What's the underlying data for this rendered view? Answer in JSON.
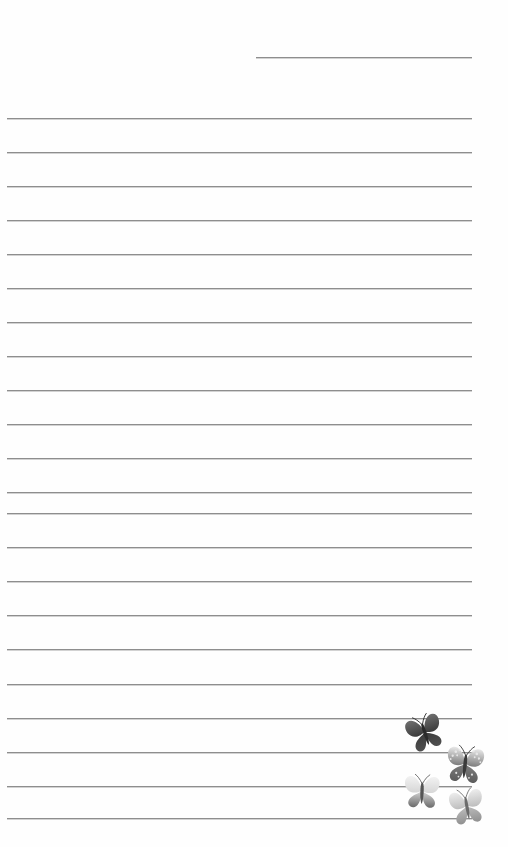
{
  "page": {
    "width": 508,
    "height": 847,
    "background_color": "#fefefe",
    "paper_style": "ruled-stationery"
  },
  "rules": {
    "line_color": "#8e8e8e",
    "shadow_color": "#d2d2d2",
    "line_thickness_px": 1,
    "left_margin_px": 7,
    "right_edge_px": 472,
    "line_spacing_px": 34,
    "header_line": {
      "label": "header-rule",
      "x": 256,
      "width": 216,
      "y": 57
    },
    "body_lines": [
      {
        "label": "line-1",
        "x": 7,
        "width": 465,
        "y": 118
      },
      {
        "label": "line-2",
        "x": 7,
        "width": 465,
        "y": 152
      },
      {
        "label": "line-3",
        "x": 7,
        "width": 465,
        "y": 186
      },
      {
        "label": "line-4",
        "x": 7,
        "width": 465,
        "y": 220
      },
      {
        "label": "line-5",
        "x": 7,
        "width": 465,
        "y": 254
      },
      {
        "label": "line-6",
        "x": 7,
        "width": 465,
        "y": 288
      },
      {
        "label": "line-7",
        "x": 7,
        "width": 465,
        "y": 322
      },
      {
        "label": "line-8",
        "x": 7,
        "width": 465,
        "y": 356
      },
      {
        "label": "line-9",
        "x": 7,
        "width": 465,
        "y": 390
      },
      {
        "label": "line-10",
        "x": 7,
        "width": 465,
        "y": 424
      },
      {
        "label": "line-11",
        "x": 7,
        "width": 465,
        "y": 458
      },
      {
        "label": "line-12",
        "x": 7,
        "width": 465,
        "y": 492
      },
      {
        "label": "line-13",
        "x": 7,
        "width": 465,
        "y": 513
      },
      {
        "label": "line-14",
        "x": 7,
        "width": 465,
        "y": 547
      },
      {
        "label": "line-15",
        "x": 7,
        "width": 465,
        "y": 581
      },
      {
        "label": "line-16",
        "x": 7,
        "width": 465,
        "y": 615
      },
      {
        "label": "line-17",
        "x": 7,
        "width": 465,
        "y": 649
      },
      {
        "label": "line-18",
        "x": 7,
        "width": 465,
        "y": 684
      },
      {
        "label": "line-19",
        "x": 7,
        "width": 465,
        "y": 718
      },
      {
        "label": "line-20",
        "x": 7,
        "width": 465,
        "y": 752
      },
      {
        "label": "line-21",
        "x": 7,
        "width": 465,
        "y": 786
      },
      {
        "label": "line-22",
        "x": 7,
        "width": 465,
        "y": 818
      }
    ]
  },
  "decorations": {
    "motif": "butterflies",
    "count": 4,
    "cluster_corner": "bottom-right",
    "butterflies": [
      {
        "name": "butterfly-dark",
        "x": 404,
        "y": 712,
        "w": 42,
        "h": 42,
        "rotation": -18,
        "top_wing_color": "#3b3b3b",
        "bottom_wing_color": "#4f4f4f",
        "accent_color": "#6e6e6e",
        "body_color": "#2a2a2a"
      },
      {
        "name": "butterfly-speckled",
        "x": 443,
        "y": 743,
        "w": 44,
        "h": 44,
        "rotation": 6,
        "top_wing_color": "#7d7d7d",
        "bottom_wing_color": "#5c5c5c",
        "accent_color": "#e8e8e8",
        "body_color": "#3a3a3a"
      },
      {
        "name": "butterfly-light-gradient",
        "x": 401,
        "y": 772,
        "w": 42,
        "h": 40,
        "rotation": 2,
        "top_wing_color": "#d6d6d6",
        "bottom_wing_color": "#6a6a6a",
        "accent_color": "#f2f2f2",
        "body_color": "#555555"
      },
      {
        "name": "butterfly-pale",
        "x": 447,
        "y": 786,
        "w": 40,
        "h": 42,
        "rotation": -10,
        "top_wing_color": "#bdbdbd",
        "bottom_wing_color": "#909090",
        "accent_color": "#ededed",
        "body_color": "#6b6b6b"
      }
    ]
  }
}
